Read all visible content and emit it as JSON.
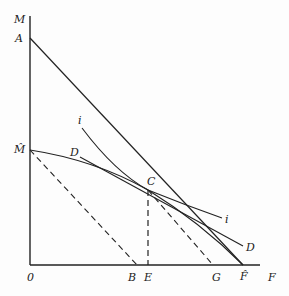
{
  "diagram": {
    "type": "economics-indifference-diagram",
    "axes": {
      "y_label": "M",
      "x_label": "F",
      "origin_label": "0"
    },
    "points": {
      "A": "A",
      "M_hat": "M̂",
      "C": "C",
      "B": "B",
      "E": "E",
      "G": "G",
      "F_hat": "F̂",
      "F": "F"
    },
    "curves": {
      "indifference_label_top": "i",
      "indifference_label_bottom": "i",
      "D_label_top": "D",
      "D_label_bottom": "D"
    },
    "colors": {
      "ink": "#222222",
      "background": "#fdfdfd"
    }
  }
}
